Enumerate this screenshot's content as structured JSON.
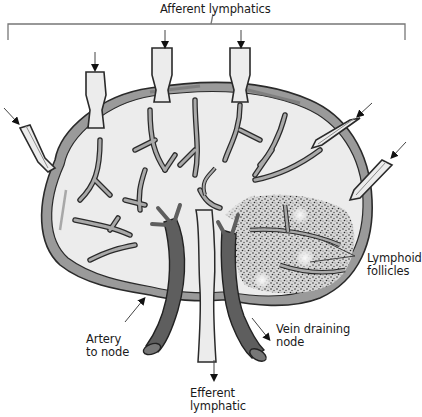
{
  "diagram": {
    "labels": {
      "afferent_lymphatics": "Afferent lymphatics",
      "artery": {
        "line1": "Artery",
        "line2": "to node"
      },
      "efferent": {
        "line1": "Efferent",
        "line2": "lymphatic"
      },
      "vein": {
        "line1": "Vein draining",
        "line2": "node"
      },
      "follicles": {
        "line1": "Lymphoid",
        "line2": "follicles"
      }
    },
    "colors": {
      "background": "#ffffff",
      "node_interior": "#ececec",
      "vessel_wall": "#8a8a8a",
      "vessel_outline": "#2a2a2a",
      "capsule": "#9a9a9a",
      "blood_vessel": "#5e5e5e",
      "follicle_stipple": "#3a3a3a",
      "text": "#1a1a1a"
    },
    "afferent_vessel_count": 6
  }
}
